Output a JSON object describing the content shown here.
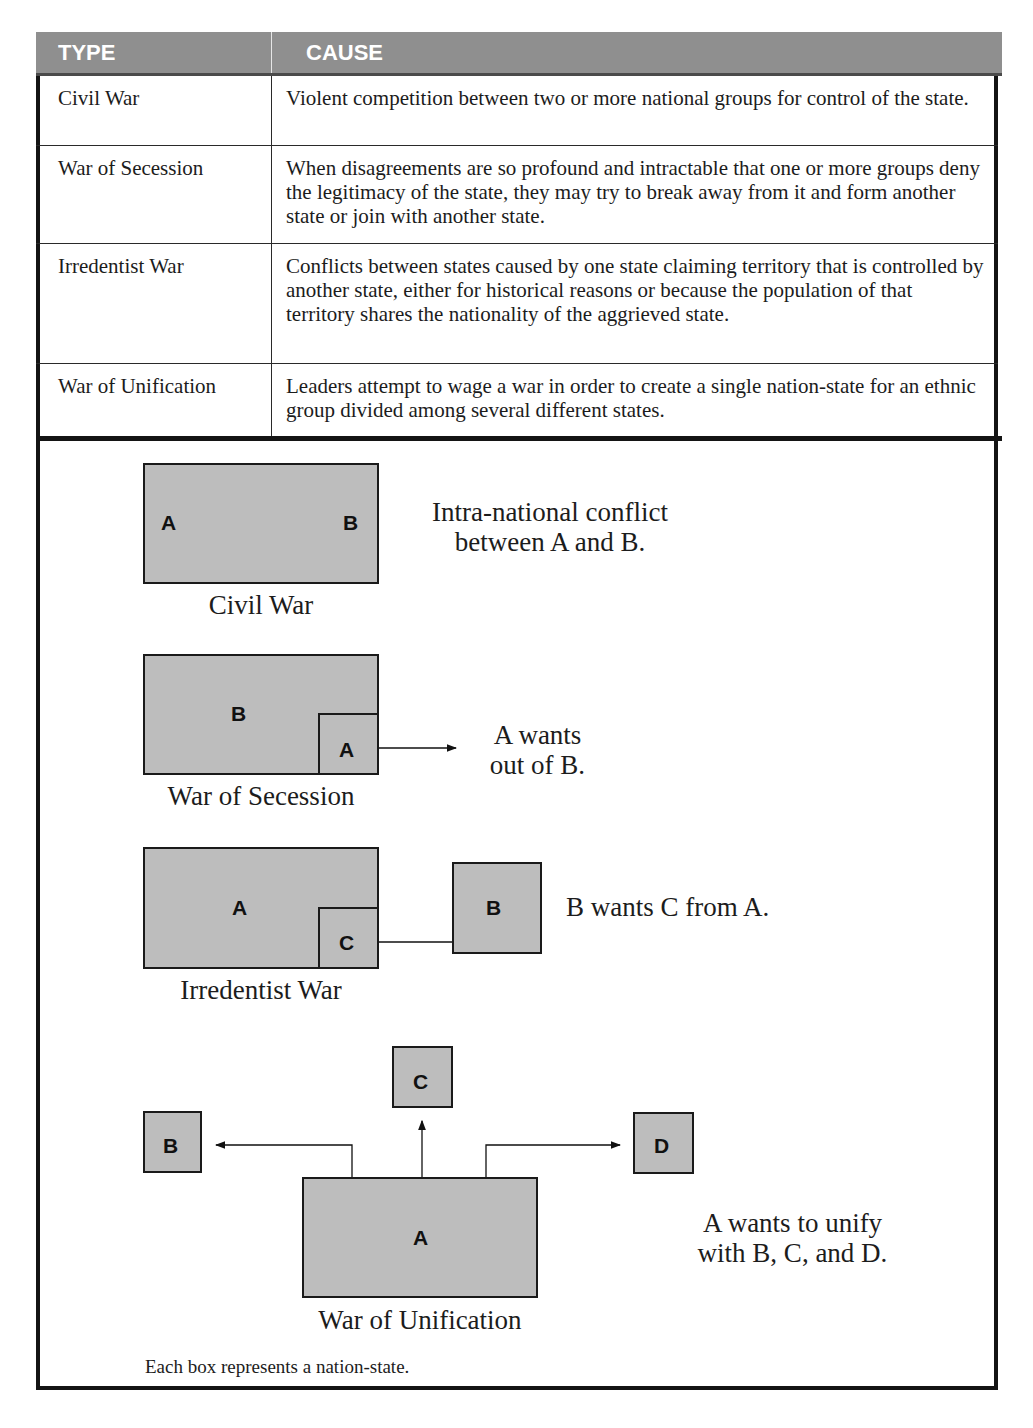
{
  "table": {
    "headers": [
      "TYPE",
      "CAUSE"
    ],
    "rows": [
      {
        "type": "Civil War",
        "cause": "Violent competition between two or more national groups for control of the state."
      },
      {
        "type": "War of Secession",
        "cause": "When disagreements are so profound and intractable that one or more groups deny the legitimacy of the state, they may try to break away from it and form another state or join with another state."
      },
      {
        "type": "Irredentist War",
        "cause": "Conflicts between states caused by one state claiming territory that is controlled by another state, either for historical reasons or because the population of that territory shares the nationality of the aggrieved state."
      },
      {
        "type": "War of Unification",
        "cause": "Leaders attempt to wage a war in order to create a single nation-state for an ethnic group divided among several different states."
      }
    ]
  },
  "diagrams": {
    "civil_war": {
      "caption": "Civil War",
      "box_labels": [
        "A",
        "B"
      ],
      "desc_line1": "Intra-national conflict",
      "desc_line2": "between A and B."
    },
    "secession": {
      "caption": "War of Secession",
      "box_labels": [
        "B",
        "A"
      ],
      "desc_line1": "A wants",
      "desc_line2": "out of B."
    },
    "irredentist": {
      "caption": "Irredentist War",
      "box_labels": [
        "A",
        "C",
        "B"
      ],
      "desc": "B wants C from A."
    },
    "unification": {
      "caption": "War of Unification",
      "box_labels": [
        "A",
        "B",
        "C",
        "D"
      ],
      "desc_line1": "A wants to unify",
      "desc_line2": "with B, C, and D."
    }
  },
  "footnote": "Each box represents a nation-state.",
  "colors": {
    "header_bg": "#8f8f8f",
    "box_fill": "#bdbdbd",
    "border": "#141414"
  }
}
